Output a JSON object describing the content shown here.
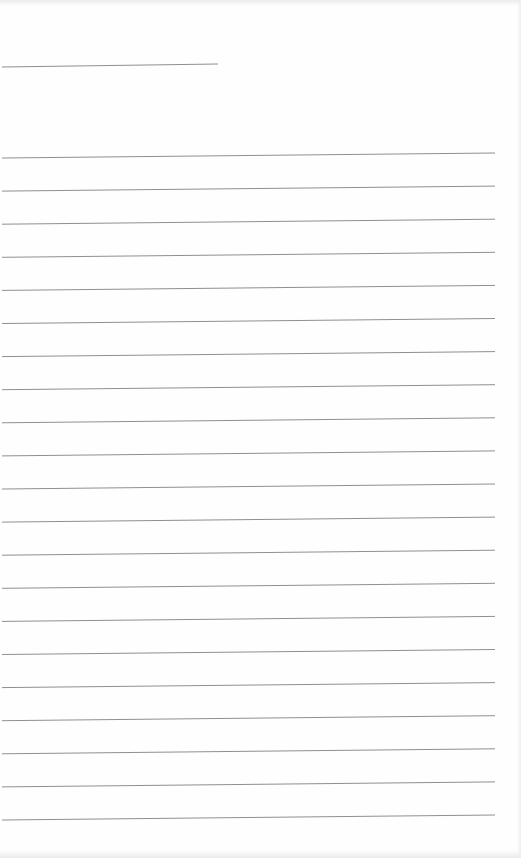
{
  "document": {
    "type": "blank ruled sheet",
    "line_color": "#8f8f8f",
    "background": "#fefefe",
    "title_line": {
      "x1": 2,
      "y1": 67,
      "x2": 218,
      "y2": 64
    },
    "ruled_lines": {
      "count": 21,
      "x_left": 2,
      "x_right": 495,
      "y_left_first": 158,
      "y_right_first": 153,
      "spacing": 33.1
    }
  }
}
